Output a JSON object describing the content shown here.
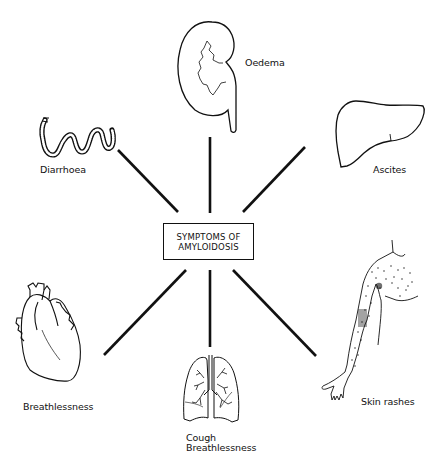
{
  "diagram": {
    "title_line1": "SYMPTOMS OF",
    "title_line2": "AMYLOIDOSIS",
    "line_color": "#111111",
    "nodes": [
      {
        "organ": "kidney",
        "icon": "kidney-icon",
        "label": "Oedema",
        "position": "top"
      },
      {
        "organ": "intestine",
        "icon": "intestine-icon",
        "label": "Diarrhoea",
        "position": "top-left"
      },
      {
        "organ": "liver",
        "icon": "liver-icon",
        "label": "Ascites",
        "position": "top-right"
      },
      {
        "organ": "heart",
        "icon": "heart-icon",
        "label": "Breathlessness",
        "position": "bottom-left"
      },
      {
        "organ": "lungs",
        "icon": "lungs-icon",
        "label_line1": "Cough",
        "label_line2": "Breathlessness",
        "position": "bottom"
      },
      {
        "organ": "skin",
        "icon": "arm-skin-icon",
        "label": "Skin rashes",
        "position": "bottom-right"
      }
    ]
  }
}
